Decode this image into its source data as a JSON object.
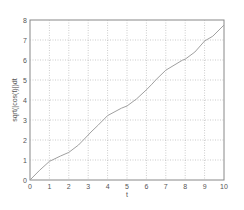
{
  "chart_data": {
    "type": "line",
    "title": "",
    "xlabel": "t",
    "ylabel": "sqrt(|cos(t)|)dt",
    "xlim": [
      0,
      10
    ],
    "ylim": [
      0,
      8
    ],
    "grid": true,
    "x_ticks": [
      "0",
      "1",
      "2",
      "3",
      "4",
      "5",
      "6",
      "7",
      "8",
      "9",
      "10"
    ],
    "y_ticks": [
      "0",
      "1",
      "2",
      "3",
      "4",
      "5",
      "6",
      "7",
      "8"
    ],
    "series": [
      {
        "name": "integral",
        "color": "#a0a0a0",
        "x": [
          0,
          0.5,
          1,
          1.571,
          2,
          2.5,
          3,
          3.142,
          3.5,
          4,
          4.712,
          5,
          5.5,
          6,
          6.283,
          6.5,
          7,
          7.854,
          8,
          8.5,
          9,
          9.425,
          10
        ],
        "y": [
          0,
          0.49,
          0.93,
          1.2,
          1.38,
          1.75,
          2.25,
          2.4,
          2.73,
          3.22,
          3.59,
          3.7,
          4.06,
          4.51,
          4.79,
          5.02,
          5.49,
          5.99,
          6.04,
          6.4,
          6.95,
          7.19,
          7.75
        ]
      }
    ]
  }
}
